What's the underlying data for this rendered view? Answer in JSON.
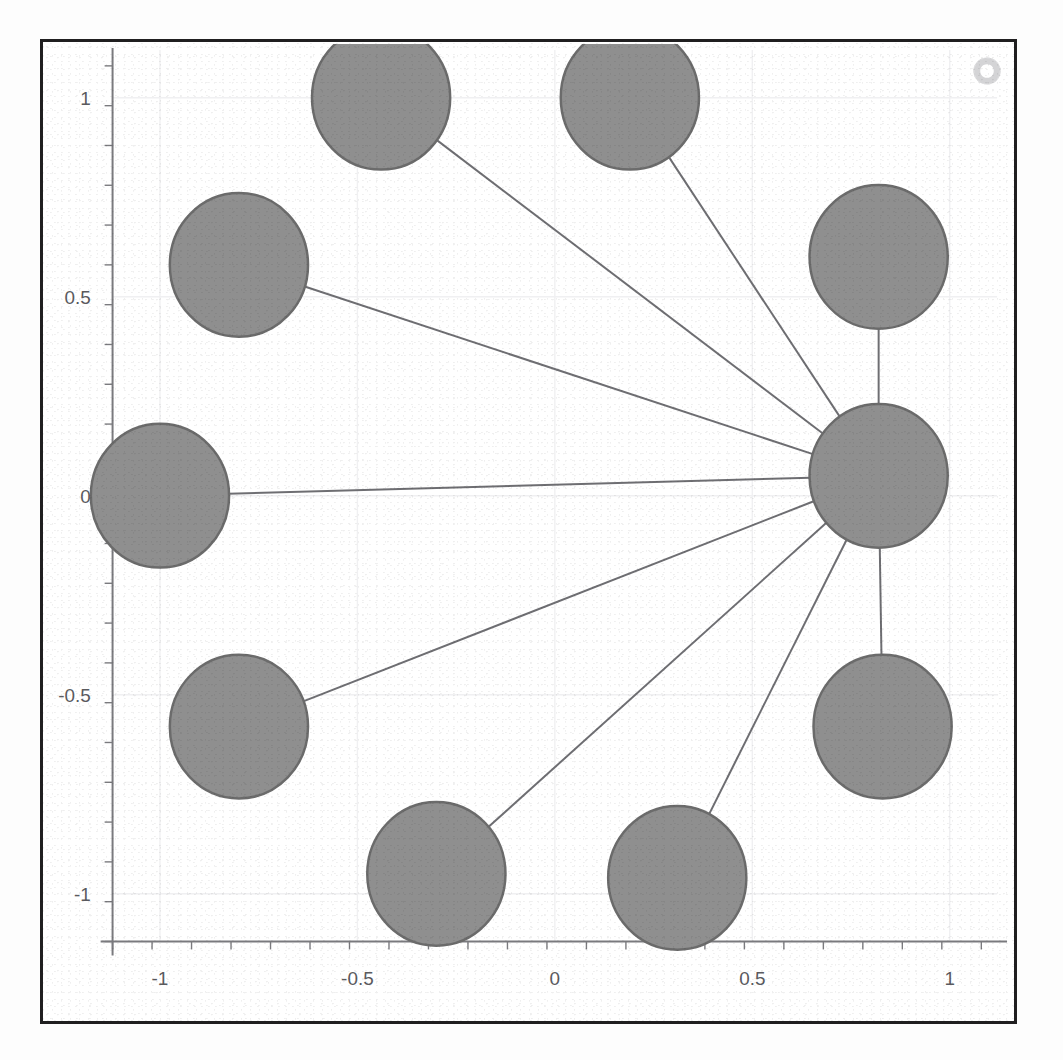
{
  "page": {
    "top_text_fragment": "the features are now searched for these."
  },
  "figure": {
    "corner_glyph": "ring-icon",
    "colors": {
      "node_fill": "#8f8f8f",
      "node_stroke": "#6b6b6b",
      "edge": "#6e6e72",
      "frame": "#201f20",
      "axis": "#7a7a7e",
      "grid": "#f0f0f2",
      "tick_label": "#5a5a5e",
      "background": "#ffffff"
    }
  },
  "chart_data": {
    "type": "scatter",
    "title": "",
    "xlabel": "",
    "ylabel": "",
    "xlim": [
      -1.12,
      1.12
    ],
    "ylim": [
      -1.12,
      1.12
    ],
    "grid": true,
    "legend": null,
    "x_ticks": [
      -1,
      -0.5,
      0,
      0.5,
      1
    ],
    "x_tick_labels": [
      "-1",
      "-0.5",
      "0",
      "0.5",
      "1"
    ],
    "y_ticks": [
      -1,
      -0.5,
      0,
      0.5,
      1
    ],
    "y_tick_labels": [
      "-1",
      "-0.5",
      "0",
      "0.5",
      "1"
    ],
    "x_minor_step": 0.1,
    "y_minor_step": 0.1,
    "node_radius_data": 0.175,
    "nodes": [
      {
        "id": "hub",
        "label": "hub",
        "x": 0.82,
        "y": 0.05,
        "r": 0.175
      },
      {
        "id": "n1",
        "label": "node-1",
        "x": -0.44,
        "y": 1.0,
        "r": 0.175
      },
      {
        "id": "n2",
        "label": "node-2",
        "x": 0.19,
        "y": 1.0,
        "r": 0.175
      },
      {
        "id": "n3",
        "label": "node-3",
        "x": 0.82,
        "y": 0.6,
        "r": 0.175
      },
      {
        "id": "n4",
        "label": "node-4",
        "x": -0.8,
        "y": 0.58,
        "r": 0.175
      },
      {
        "id": "n5",
        "label": "node-5",
        "x": -1.0,
        "y": 0.0,
        "r": 0.175
      },
      {
        "id": "n6",
        "label": "node-6",
        "x": -0.8,
        "y": -0.58,
        "r": 0.175
      },
      {
        "id": "n7",
        "label": "node-7",
        "x": -0.3,
        "y": -0.95,
        "r": 0.175
      },
      {
        "id": "n8",
        "label": "node-8",
        "x": 0.31,
        "y": -0.96,
        "r": 0.175
      },
      {
        "id": "n9",
        "label": "node-9",
        "x": 0.83,
        "y": -0.58,
        "r": 0.175
      }
    ],
    "edges": [
      {
        "from": "n1",
        "to": "hub"
      },
      {
        "from": "n2",
        "to": "hub"
      },
      {
        "from": "n3",
        "to": "hub"
      },
      {
        "from": "n4",
        "to": "hub"
      },
      {
        "from": "n5",
        "to": "hub"
      },
      {
        "from": "n6",
        "to": "hub"
      },
      {
        "from": "n7",
        "to": "hub"
      },
      {
        "from": "n8",
        "to": "hub"
      },
      {
        "from": "n9",
        "to": "hub"
      }
    ]
  }
}
